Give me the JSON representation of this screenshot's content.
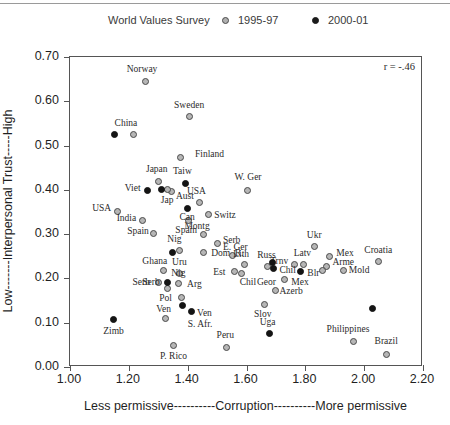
{
  "legend": {
    "title": "World Values Survey",
    "entries": [
      {
        "label": "1995-97",
        "marker": "open-circle-icon"
      },
      {
        "label": "2000-01",
        "marker": "filled-circle-icon"
      }
    ]
  },
  "annotation": {
    "r_text": "r = -.46"
  },
  "axes": {
    "x": {
      "label": "Less permissive----------Corruption----------More permissive",
      "ticks": [
        "1.00",
        "1.20",
        "1.40",
        "1.60",
        "1.80",
        "2.00",
        "2.20"
      ],
      "min": 1.0,
      "max": 2.2
    },
    "y": {
      "label": "Low-------Interpersonal Trust-----High",
      "ticks": [
        "0.00",
        "0.10",
        "0.20",
        "0.30",
        "0.40",
        "0.50",
        "0.60",
        "0.70"
      ],
      "min": 0.0,
      "max": 0.7
    }
  },
  "chart_data": {
    "type": "scatter",
    "title": "World Values Survey",
    "xlabel": "Less permissive----------Corruption----------More permissive",
    "ylabel": "Low-------Interpersonal Trust-----High",
    "xlim": [
      1.0,
      2.2
    ],
    "ylim": [
      0.0,
      0.7
    ],
    "grid": false,
    "legend_position": "top",
    "annotations": [
      "r = -.46"
    ],
    "series": [
      {
        "name": "1995-97",
        "marker": "open-circle",
        "points": [
          {
            "label": "Norway",
            "x": 1.255,
            "y": 0.645,
            "lx": 1.245,
            "ly": 0.672,
            "anchor": "center"
          },
          {
            "label": "Sweden",
            "x": 1.405,
            "y": 0.565,
            "lx": 1.405,
            "ly": 0.592,
            "anchor": "center"
          },
          {
            "label": "China",
            "x": 1.215,
            "y": 0.525,
            "lx": 1.19,
            "ly": 0.552,
            "anchor": "center"
          },
          {
            "label": "Finland",
            "x": 1.375,
            "y": 0.472,
            "lx": 1.425,
            "ly": 0.48,
            "anchor": "start"
          },
          {
            "label": "Japan",
            "x": 1.3,
            "y": 0.42,
            "lx": 1.295,
            "ly": 0.448,
            "anchor": "center"
          },
          {
            "label": "W. Ger",
            "x": 1.605,
            "y": 0.398,
            "lx": 1.605,
            "ly": 0.428,
            "anchor": "center"
          },
          {
            "label": "Aust",
            "x": 1.345,
            "y": 0.396,
            "lx": 1.36,
            "ly": 0.386,
            "anchor": "start"
          },
          {
            "label": "USA",
            "x": 1.16,
            "y": 0.352,
            "lx": 1.14,
            "ly": 0.358,
            "anchor": "end"
          },
          {
            "label": "USA",
            "x": 1.44,
            "y": 0.372,
            "lx": 1.43,
            "ly": 0.398,
            "anchor": "center"
          },
          {
            "label": "India",
            "x": 1.245,
            "y": 0.33,
            "lx": 1.225,
            "ly": 0.336,
            "anchor": "end"
          },
          {
            "label": "Switz",
            "x": 1.47,
            "y": 0.345,
            "lx": 1.49,
            "ly": 0.344,
            "anchor": "start"
          },
          {
            "label": "Spain",
            "x": 1.285,
            "y": 0.302,
            "lx": 1.268,
            "ly": 0.308,
            "anchor": "end"
          },
          {
            "label": "Montg",
            "x": 1.455,
            "y": 0.3,
            "lx": 1.432,
            "ly": 0.318,
            "anchor": "center"
          },
          {
            "label": "Serb",
            "x": 1.5,
            "y": 0.278,
            "lx": 1.52,
            "ly": 0.286,
            "anchor": "start"
          },
          {
            "label": "Nig",
            "x": 1.372,
            "y": 0.262,
            "lx": 1.355,
            "ly": 0.288,
            "anchor": "center"
          },
          {
            "label": "Dom. R.",
            "x": 1.455,
            "y": 0.258,
            "lx": 1.48,
            "ly": 0.258,
            "anchor": "start"
          },
          {
            "label": "E. Ger",
            "x": 1.552,
            "y": 0.252,
            "lx": 1.562,
            "ly": 0.272,
            "anchor": "center"
          },
          {
            "label": "Ukr",
            "x": 1.83,
            "y": 0.272,
            "lx": 1.83,
            "ly": 0.298,
            "anchor": "center"
          },
          {
            "label": "Mex",
            "x": 1.882,
            "y": 0.25,
            "lx": 1.905,
            "ly": 0.258,
            "anchor": "start"
          },
          {
            "label": "Croatia",
            "x": 2.048,
            "y": 0.238,
            "lx": 2.048,
            "ly": 0.265,
            "anchor": "center"
          },
          {
            "label": "Latv",
            "x": 1.795,
            "y": 0.232,
            "lx": 1.79,
            "ly": 0.258,
            "anchor": "center"
          },
          {
            "label": "Lith",
            "x": 1.592,
            "y": 0.232,
            "lx": 1.582,
            "ly": 0.256,
            "anchor": "center"
          },
          {
            "label": "Trnv",
            "x": 1.762,
            "y": 0.232,
            "lx": 1.742,
            "ly": 0.24,
            "anchor": "end"
          },
          {
            "label": "Arme",
            "x": 1.872,
            "y": 0.228,
            "lx": 1.892,
            "ly": 0.236,
            "anchor": "start"
          },
          {
            "label": "Mold",
            "x": 1.93,
            "y": 0.218,
            "lx": 1.948,
            "ly": 0.218,
            "anchor": "start"
          },
          {
            "label": "Blr",
            "x": 1.858,
            "y": 0.218,
            "lx": 1.848,
            "ly": 0.213,
            "anchor": "end"
          },
          {
            "label": "Ghana",
            "x": 1.318,
            "y": 0.218,
            "lx": 1.288,
            "ly": 0.24,
            "anchor": "center"
          },
          {
            "label": "Uru",
            "x": 1.372,
            "y": 0.212,
            "lx": 1.372,
            "ly": 0.236,
            "anchor": "center"
          },
          {
            "label": "Est",
            "x": 1.56,
            "y": 0.215,
            "lx": 1.528,
            "ly": 0.215,
            "anchor": "end"
          },
          {
            "label": "Chil",
            "x": 1.582,
            "y": 0.212,
            "lx": 1.605,
            "ly": 0.192,
            "anchor": "center"
          },
          {
            "label": "Russ",
            "x": 1.672,
            "y": 0.228,
            "lx": 1.668,
            "ly": 0.254,
            "anchor": "center"
          },
          {
            "label": "Geor",
            "x": 1.73,
            "y": 0.198,
            "lx": 1.7,
            "ly": 0.192,
            "anchor": "end"
          },
          {
            "label": "Azerb",
            "x": 1.7,
            "y": 0.172,
            "lx": 1.712,
            "ly": 0.172,
            "anchor": "start"
          },
          {
            "label": "Slov",
            "x": 1.66,
            "y": 0.142,
            "lx": 1.655,
            "ly": 0.12,
            "anchor": "center"
          },
          {
            "label": "Pol",
            "x": 1.332,
            "y": 0.178,
            "lx": 1.325,
            "ly": 0.155,
            "anchor": "center"
          },
          {
            "label": "Serb",
            "x": 1.3,
            "y": 0.19,
            "lx": 1.272,
            "ly": 0.192,
            "anchor": "end"
          },
          {
            "label": "Nig",
            "x": 1.37,
            "y": 0.188,
            "lx": 1.368,
            "ly": 0.212,
            "anchor": "center"
          },
          {
            "label": "Arg",
            "x": 1.378,
            "y": 0.158,
            "lx": 1.398,
            "ly": 0.188,
            "anchor": "start"
          },
          {
            "label": "Ven",
            "x": 1.325,
            "y": 0.11,
            "lx": 1.318,
            "ly": 0.13,
            "anchor": "center"
          },
          {
            "label": "Peru",
            "x": 1.532,
            "y": 0.045,
            "lx": 1.528,
            "ly": 0.072,
            "anchor": "center"
          },
          {
            "label": "P. Rico",
            "x": 1.352,
            "y": 0.048,
            "lx": 1.352,
            "ly": 0.025,
            "anchor": "center"
          },
          {
            "label": "Philippines",
            "x": 1.965,
            "y": 0.058,
            "lx": 1.945,
            "ly": 0.085,
            "anchor": "center"
          },
          {
            "label": "Brazil",
            "x": 2.075,
            "y": 0.028,
            "lx": 2.075,
            "ly": 0.058,
            "anchor": "center"
          },
          {
            "label": "Jap",
            "x": 1.332,
            "y": 0.4,
            "lx": 1.33,
            "ly": 0.378,
            "anchor": "center"
          },
          {
            "label": "Spain",
            "x": 1.402,
            "y": 0.33,
            "lx": 1.395,
            "ly": 0.31,
            "anchor": "center"
          }
        ]
      },
      {
        "name": "2000-01",
        "marker": "filled-circle",
        "points": [
          {
            "label": "China",
            "x": 1.15,
            "y": 0.525,
            "lx": 1.15,
            "ly": 0.525,
            "anchor": "none"
          },
          {
            "label": "Taiw",
            "x": 1.392,
            "y": 0.415,
            "lx": 1.382,
            "ly": 0.442,
            "anchor": "center"
          },
          {
            "label": "Viet",
            "x": 1.262,
            "y": 0.398,
            "lx": 1.24,
            "ly": 0.404,
            "anchor": "end"
          },
          {
            "label": "Aust",
            "x": 1.312,
            "y": 0.4,
            "lx": 1.312,
            "ly": 0.4,
            "anchor": "none"
          },
          {
            "label": "Can",
            "x": 1.398,
            "y": 0.358,
            "lx": 1.398,
            "ly": 0.338,
            "anchor": "center"
          },
          {
            "label": "Nig",
            "x": 1.348,
            "y": 0.258,
            "lx": 1.348,
            "ly": 0.258,
            "anchor": "none"
          },
          {
            "label": "Russ",
            "x": 1.688,
            "y": 0.235,
            "lx": 1.688,
            "ly": 0.235,
            "anchor": "none"
          },
          {
            "label": "Chil",
            "x": 1.692,
            "y": 0.222,
            "lx": 1.712,
            "ly": 0.22,
            "anchor": "start"
          },
          {
            "label": "Mex",
            "x": 1.782,
            "y": 0.215,
            "lx": 1.782,
            "ly": 0.192,
            "anchor": "center"
          },
          {
            "label": "Serb",
            "x": 1.33,
            "y": 0.19,
            "lx": 1.305,
            "ly": 0.192,
            "anchor": "end"
          },
          {
            "label": "Ven",
            "x": 1.412,
            "y": 0.125,
            "lx": 1.432,
            "ly": 0.122,
            "anchor": "start"
          },
          {
            "label": "S. Afr.",
            "x": 1.382,
            "y": 0.14,
            "lx": 1.442,
            "ly": 0.098,
            "anchor": "center"
          },
          {
            "label": "Zimb",
            "x": 1.148,
            "y": 0.108,
            "lx": 1.148,
            "ly": 0.082,
            "anchor": "center"
          },
          {
            "label": "Uga",
            "x": 1.678,
            "y": 0.075,
            "lx": 1.672,
            "ly": 0.102,
            "anchor": "center"
          },
          {
            "label": "Philippines-2000",
            "x": 2.028,
            "y": 0.132,
            "lx": 2.028,
            "ly": 0.132,
            "anchor": "none"
          }
        ]
      }
    ]
  }
}
